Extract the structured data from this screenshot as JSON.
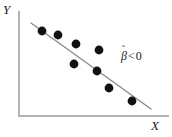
{
  "figure": {
    "width": 172,
    "height": 137,
    "background_color": "#ffffff"
  },
  "labels": {
    "y_axis": "Y",
    "x_axis": "X"
  },
  "annotation": {
    "symbol": "β",
    "hat": "ˆ",
    "relation": "<",
    "value": "0",
    "full_text": "β̂ < 0",
    "color": "#1a1a1a"
  },
  "chart_data": {
    "type": "scatter",
    "title": "",
    "xlabel": "X",
    "ylabel": "Y",
    "xlim": [
      0,
      100
    ],
    "ylim": [
      0,
      100
    ],
    "grid": false,
    "legend": null,
    "axis_color": "#b4b4b4",
    "point_color": "#111111",
    "point_radius_px": 4.4,
    "line_color": "#8c8c8c",
    "annotations": [
      {
        "text": "β̂ < 0",
        "x_px": 121,
        "y_px": 50,
        "meaning": "estimated slope coefficient is negative"
      }
    ],
    "axes_px": {
      "y_axis_x": 19,
      "y_axis_top_y": 12,
      "x_axis_y": 116,
      "x_axis_right_x": 168,
      "origin_px": [
        19,
        116
      ]
    },
    "fit_line": {
      "kind": "ols-regression-line",
      "slope_sign": "negative",
      "x1_px": 31,
      "y1_px": 23,
      "x2_px": 151,
      "y2_px": 109
    },
    "points_px": [
      {
        "x": 42,
        "y": 31
      },
      {
        "x": 58,
        "y": 35
      },
      {
        "x": 76,
        "y": 44
      },
      {
        "x": 99,
        "y": 50
      },
      {
        "x": 74,
        "y": 64
      },
      {
        "x": 97,
        "y": 71
      },
      {
        "x": 109,
        "y": 88
      },
      {
        "x": 132,
        "y": 101
      }
    ],
    "points": [
      {
        "x": 15,
        "y": 82
      },
      {
        "x": 26,
        "y": 78
      },
      {
        "x": 38,
        "y": 69
      },
      {
        "x": 54,
        "y": 63
      },
      {
        "x": 37,
        "y": 50
      },
      {
        "x": 52,
        "y": 43
      },
      {
        "x": 60,
        "y": 27
      },
      {
        "x": 76,
        "y": 14
      }
    ]
  }
}
